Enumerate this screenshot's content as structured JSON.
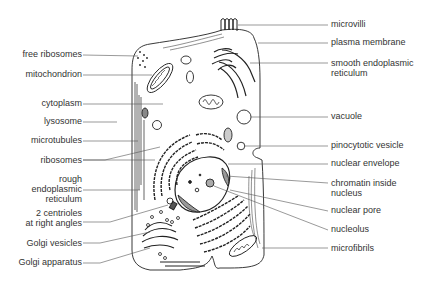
{
  "diagram": {
    "labels_left": [
      {
        "id": "free-ribosomes",
        "text": "free ribosomes",
        "x": 80,
        "y": 54
      },
      {
        "id": "mitochondrion",
        "text": "mitochondrion",
        "x": 80,
        "y": 74
      },
      {
        "id": "cytoplasm",
        "text": "cytoplasm",
        "x": 80,
        "y": 103
      },
      {
        "id": "lysosome",
        "text": "lysosome",
        "x": 80,
        "y": 121
      },
      {
        "id": "microtubules",
        "text": "microtubules",
        "x": 80,
        "y": 140
      },
      {
        "id": "ribosomes",
        "text": "ribosomes",
        "x": 80,
        "y": 160
      },
      {
        "id": "rough-er",
        "text": "rough\nendoplasmic\nreticulum",
        "x": 80,
        "y": 183
      },
      {
        "id": "centrioles",
        "text": "2 centrioles\nat right angles",
        "x": 80,
        "y": 216
      },
      {
        "id": "golgi-vesicles",
        "text": "Golgi vesicles",
        "x": 80,
        "y": 243
      },
      {
        "id": "golgi-apparatus",
        "text": "Golgi apparatus",
        "x": 80,
        "y": 262
      }
    ],
    "labels_right": [
      {
        "id": "microvilli",
        "text": "microvilli",
        "x": 330,
        "y": 23
      },
      {
        "id": "plasma-membrane",
        "text": "plasma membrane",
        "x": 330,
        "y": 42
      },
      {
        "id": "smooth-er",
        "text": "smooth endoplasmic\nreticulum",
        "x": 330,
        "y": 62
      },
      {
        "id": "vacuole",
        "text": "vacuole",
        "x": 330,
        "y": 116
      },
      {
        "id": "pinocytotic-vesicle",
        "text": "pinocytotic vesicle",
        "x": 330,
        "y": 145
      },
      {
        "id": "nuclear-envelope",
        "text": "nuclear envelope",
        "x": 330,
        "y": 163
      },
      {
        "id": "chromatin",
        "text": "chromatin inside\nnucleus",
        "x": 330,
        "y": 182
      },
      {
        "id": "nuclear-pore",
        "text": "nuclear pore",
        "x": 330,
        "y": 209
      },
      {
        "id": "nucleolus",
        "text": "nucleolus",
        "x": 330,
        "y": 228
      },
      {
        "id": "microfibrils",
        "text": "microfibrils",
        "x": 330,
        "y": 247
      }
    ]
  }
}
